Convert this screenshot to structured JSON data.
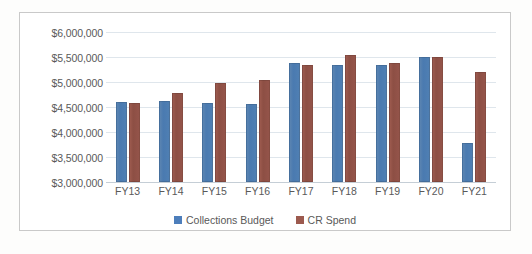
{
  "chart_data": {
    "type": "bar",
    "title": "",
    "xlabel": "",
    "ylabel": "",
    "categories": [
      "FY13",
      "FY14",
      "FY15",
      "FY16",
      "FY17",
      "FY18",
      "FY19",
      "FY20",
      "FY21"
    ],
    "series": [
      {
        "name": "Collections Budget",
        "color": "#4d7ebb",
        "values": [
          4610000,
          4630000,
          4580000,
          4560000,
          5390000,
          5350000,
          5350000,
          5510000,
          3790000
        ]
      },
      {
        "name": "CR Spend",
        "color": "#9c5a4e",
        "values": [
          4580000,
          4780000,
          4990000,
          5050000,
          5350000,
          5550000,
          5390000,
          5510000,
          5210000
        ]
      }
    ],
    "ylim": [
      3000000,
      6000000
    ],
    "ytick_values": [
      3000000,
      3500000,
      4000000,
      4500000,
      5000000,
      5500000,
      6000000
    ],
    "ytick_labels": [
      "$3,000,000",
      "$3,500,000",
      "$4,000,000",
      "$4,500,000",
      "$5,000,000",
      "$5,500,000",
      "$6,000,000"
    ],
    "grid": true,
    "legend_position": "bottom",
    "legend_entries": [
      "Collections Budget",
      "CR Spend"
    ]
  }
}
